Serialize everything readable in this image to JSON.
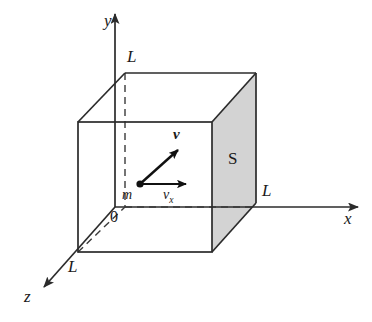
{
  "figure": {
    "background_color": "#ffffff",
    "line_color": "#2b2b2b",
    "shaded_face_color": "#d2d2d2"
  },
  "axes": {
    "x_label": "x",
    "y_label": "y",
    "z_label": "z",
    "origin_label": "0"
  },
  "box": {
    "edge_label_y": "L",
    "edge_label_x": "L",
    "edge_label_z": "L",
    "face_label": "S"
  },
  "particle": {
    "mass_label": "m",
    "velocity_label": "v",
    "velocity_x_label": "v",
    "velocity_x_subscript": "x"
  }
}
